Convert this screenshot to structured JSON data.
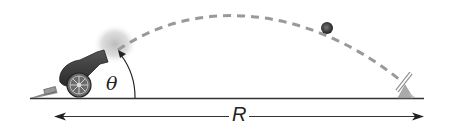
{
  "diagram": {
    "labels": {
      "angle": "θ",
      "range": "R"
    },
    "elements": {
      "cannon": "cannon-icon",
      "trajectory": "dashed parabolic path",
      "projectile": "cannonball",
      "target": "target-marker",
      "ground": "ground line",
      "range_arrow": "double-headed arrow"
    },
    "colors": {
      "ground": "#333333",
      "trajectory": "#999999",
      "cannon": "#3a3a3a",
      "smoke": "#bdbdbd",
      "ball": "#333333",
      "target": "#aaaaaa"
    }
  }
}
